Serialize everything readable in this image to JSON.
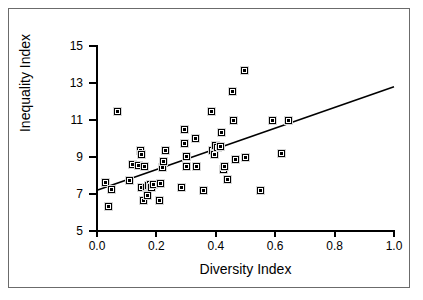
{
  "chart_data": {
    "type": "scatter",
    "title": "",
    "xlabel": "Diversity Index",
    "ylabel": "Inequality Index",
    "xlim": [
      0.0,
      1.0
    ],
    "ylim": [
      5,
      15
    ],
    "xticks": [
      "0.0",
      "0.2",
      "0.4",
      "0.6",
      "0.8",
      "1.0"
    ],
    "xtick_values": [
      0.0,
      0.2,
      0.4,
      0.6,
      0.8,
      1.0
    ],
    "yticks": [
      "5",
      "7",
      "9",
      "11",
      "13",
      "15"
    ],
    "ytick_values": [
      5,
      7,
      9,
      11,
      13,
      15
    ],
    "grid": false,
    "legend": "none",
    "marker": "filled-square-with-dot",
    "marker_color": "#000000",
    "points": [
      [
        0.04,
        6.3
      ],
      [
        0.03,
        7.6
      ],
      [
        0.05,
        7.25
      ],
      [
        0.07,
        11.45
      ],
      [
        0.11,
        7.75
      ],
      [
        0.12,
        8.6
      ],
      [
        0.14,
        8.55
      ],
      [
        0.145,
        9.35
      ],
      [
        0.15,
        9.15
      ],
      [
        0.15,
        7.35
      ],
      [
        0.155,
        6.65
      ],
      [
        0.16,
        8.5
      ],
      [
        0.165,
        7.35
      ],
      [
        0.17,
        7.0
      ],
      [
        0.17,
        6.9
      ],
      [
        0.175,
        7.45
      ],
      [
        0.18,
        7.5
      ],
      [
        0.185,
        7.35
      ],
      [
        0.19,
        7.5
      ],
      [
        0.21,
        6.65
      ],
      [
        0.215,
        7.55
      ],
      [
        0.22,
        8.45
      ],
      [
        0.225,
        8.75
      ],
      [
        0.23,
        9.35
      ],
      [
        0.285,
        7.35
      ],
      [
        0.295,
        10.5
      ],
      [
        0.295,
        9.75
      ],
      [
        0.3,
        9.05
      ],
      [
        0.3,
        8.5
      ],
      [
        0.33,
        10.0
      ],
      [
        0.335,
        8.5
      ],
      [
        0.36,
        7.2
      ],
      [
        0.385,
        11.45
      ],
      [
        0.39,
        9.35
      ],
      [
        0.395,
        9.15
      ],
      [
        0.4,
        9.6
      ],
      [
        0.405,
        9.5
      ],
      [
        0.415,
        9.55
      ],
      [
        0.42,
        10.35
      ],
      [
        0.425,
        8.3
      ],
      [
        0.43,
        8.5
      ],
      [
        0.44,
        7.8
      ],
      [
        0.455,
        12.55
      ],
      [
        0.46,
        11.0
      ],
      [
        0.465,
        8.85
      ],
      [
        0.495,
        13.7
      ],
      [
        0.5,
        9.0
      ],
      [
        0.55,
        7.2
      ],
      [
        0.59,
        10.95
      ],
      [
        0.62,
        9.2
      ],
      [
        0.645,
        10.95
      ]
    ],
    "trend_line": {
      "type": "linear-fit",
      "x0": 0.0,
      "y0": 7.2,
      "x1": 1.0,
      "y1": 12.8,
      "color": "#000000"
    }
  }
}
